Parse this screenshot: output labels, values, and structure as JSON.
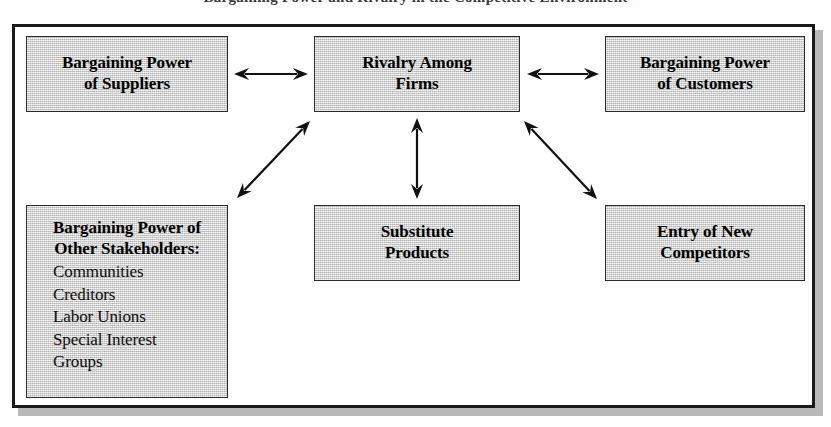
{
  "caption": {
    "text": "Bargaining Power and Rivalry in the Competitive Environment",
    "note": "clipped at top edge of screenshot"
  },
  "diagram": {
    "frame": {
      "border_color": "#1a1a1a",
      "background_color": "#ffffff",
      "shadow_color": "#b9b9b9"
    },
    "box_style": {
      "fill_color": "#d6d6d6",
      "border_color": "#2b2b2b",
      "text_color": "#000000"
    },
    "boxes": [
      {
        "id": "suppliers",
        "lines": [
          "Bargaining Power",
          "of Suppliers"
        ],
        "x": 26,
        "y": 36,
        "w": 202,
        "h": 76
      },
      {
        "id": "rivalry",
        "lines": [
          "Rivalry Among",
          "Firms"
        ],
        "x": 314,
        "y": 36,
        "w": 206,
        "h": 76
      },
      {
        "id": "customers",
        "lines": [
          "Bargaining Power",
          "of Customers"
        ],
        "x": 605,
        "y": 36,
        "w": 200,
        "h": 76
      },
      {
        "id": "stakeholders",
        "heading_lines": [
          "Bargaining Power of",
          "Other Stakeholders:"
        ],
        "items": [
          "Communities",
          "Creditors",
          "Labor Unions",
          "Special Interest",
          "Groups"
        ],
        "x": 26,
        "y": 205,
        "w": 202,
        "h": 193
      },
      {
        "id": "substitutes",
        "lines": [
          "Substitute",
          "Products"
        ],
        "x": 314,
        "y": 205,
        "w": 206,
        "h": 76
      },
      {
        "id": "entrants",
        "lines": [
          "Entry of New",
          "Competitors"
        ],
        "x": 605,
        "y": 205,
        "w": 200,
        "h": 76
      }
    ],
    "arrows": [
      {
        "id": "suppliers-rivalry",
        "style": "double-headed",
        "orientation": "horizontal",
        "from": "suppliers",
        "to": "rivalry",
        "x1": 234,
        "y1": 74,
        "x2": 308,
        "y2": 74
      },
      {
        "id": "rivalry-customers",
        "style": "double-headed",
        "orientation": "horizontal",
        "from": "rivalry",
        "to": "customers",
        "x1": 527,
        "y1": 74,
        "x2": 599,
        "y2": 74
      },
      {
        "id": "rivalry-substitutes",
        "style": "double-headed",
        "orientation": "vertical",
        "from": "rivalry",
        "to": "substitutes",
        "x1": 417,
        "y1": 118,
        "x2": 417,
        "y2": 199
      },
      {
        "id": "stakeholders-rivalry",
        "style": "double-headed",
        "orientation": "diagonal-up-right",
        "from": "stakeholders",
        "to": "rivalry",
        "x1": 237,
        "y1": 198,
        "x2": 310,
        "y2": 121
      },
      {
        "id": "rivalry-entrants",
        "style": "double-headed",
        "orientation": "diagonal-down-right",
        "from": "rivalry",
        "to": "entrants",
        "x1": 524,
        "y1": 121,
        "x2": 597,
        "y2": 199
      }
    ]
  }
}
